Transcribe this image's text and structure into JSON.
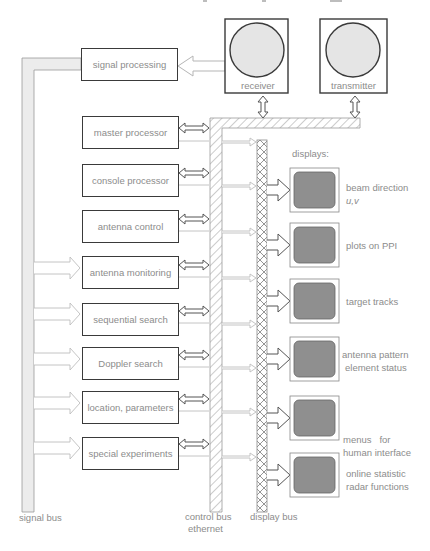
{
  "diagram": {
    "type": "radar system block diagram",
    "modules": [
      {
        "id": "signal_processing",
        "label": "signal processing"
      },
      {
        "id": "master_processor",
        "label": "master processor"
      },
      {
        "id": "console_processor",
        "label": "console processor"
      },
      {
        "id": "antenna_control",
        "label": "antenna control"
      },
      {
        "id": "antenna_monitoring",
        "label": "antenna monitoring"
      },
      {
        "id": "sequential_search",
        "label": "sequential search"
      },
      {
        "id": "doppler_search",
        "label": "Doppler search"
      },
      {
        "id": "location_parameters",
        "label": "location, parameters"
      },
      {
        "id": "special_experiments",
        "label": "special experiments"
      }
    ],
    "hardware": [
      {
        "id": "receiver",
        "label": "receiver"
      },
      {
        "id": "transmitter",
        "label": "transmitter"
      }
    ],
    "displays_heading": "displays:",
    "displays": [
      {
        "line1": "beam direction",
        "line2": "u,v"
      },
      {
        "line1": "plots on PPI",
        "line2": ""
      },
      {
        "line1": "target tracks",
        "line2": ""
      },
      {
        "line1": "antenna pattern",
        "line2": "element status"
      },
      {
        "line1": "menus   for",
        "line2": "human interface"
      },
      {
        "line1": "online statistic",
        "line2": "radar functions"
      }
    ],
    "buses": {
      "signal_bus": "signal bus",
      "control_bus_line1": "control bus",
      "control_bus_line2": "ethernet",
      "display_bus": "display bus"
    },
    "colors": {
      "box_border": "#3a3a3a",
      "screen_fill": "#8f8f8f",
      "bus_fill": "#ececec",
      "text": "#8c8c8c"
    }
  }
}
